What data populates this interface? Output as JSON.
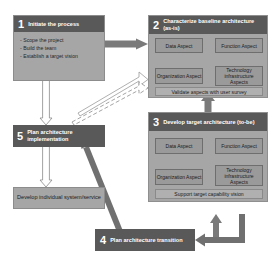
{
  "diagram": {
    "colors": {
      "header_fill": "#595959",
      "box_fill": "#a6a6a6",
      "aspect_fill": "#9a9a9a",
      "footer_fill": "#b0b0b0",
      "arrow_solid": "#808080",
      "arrow_dark": "#707070",
      "arrow_hollow": "#ffffff",
      "text_light": "#ffffff",
      "text_dark": "#1a1a1a"
    },
    "steps": {
      "step1": {
        "number": "1",
        "title": "Initiate the process",
        "bullets": [
          "- Scope the project",
          "- Build the team",
          "- Establish a target vision"
        ]
      },
      "step2": {
        "number": "2",
        "title": "Characterize baseline architecture  (as-is)",
        "aspects": {
          "data": "Data Aspect",
          "function": "Function Aspect",
          "organization": "Organization Aspect",
          "technology": "Technology infrastructure Aspects"
        },
        "footer": "Validate aspects with user survey"
      },
      "step3": {
        "number": "3",
        "title": "Develop target architecture (to-be)",
        "aspects": {
          "data": "Data Aspect",
          "function": "Function Aspect",
          "organization": "Organization Aspect",
          "technology": "Technology infrastructure Aspects"
        },
        "footer": "Support target capability vision"
      },
      "step4": {
        "number": "4",
        "title": "Plan architecture transition"
      },
      "step5": {
        "number": "5",
        "title": "Plan architecture implementation"
      },
      "develop": {
        "title": "Develop individual system/service"
      }
    }
  }
}
